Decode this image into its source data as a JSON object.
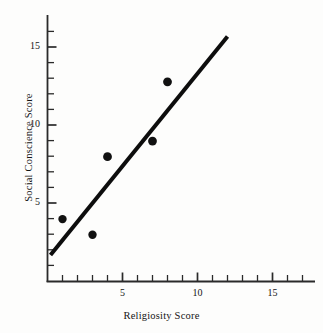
{
  "chart_data": {
    "type": "scatter",
    "title": "",
    "xlabel": "Religiosity Score",
    "ylabel": "Social Conscience Score",
    "xlim": [
      0,
      17.8
    ],
    "ylim": [
      0,
      17
    ],
    "grid": false,
    "legend": "none",
    "x": [
      1,
      3,
      4,
      7,
      8
    ],
    "y": [
      4,
      3,
      8,
      9,
      12.8
    ],
    "points": [
      {
        "x": 1,
        "y": 4
      },
      {
        "x": 3,
        "y": 3
      },
      {
        "x": 4,
        "y": 8
      },
      {
        "x": 7,
        "y": 9
      },
      {
        "x": 8,
        "y": 12.8
      }
    ],
    "xticks_major": [
      5,
      10,
      15
    ],
    "yticks_major": [
      5,
      10,
      15
    ],
    "xtick_labels": [
      "5",
      "10",
      "15"
    ],
    "ytick_labels": [
      "5",
      "10",
      "15"
    ],
    "xticks_minor_step": 1,
    "yticks_minor_step": 1,
    "marker": "filled-circle",
    "marker_color": "#111111",
    "series": [
      {
        "name": "observations",
        "values": [
          {
            "x": 1,
            "y": 4
          },
          {
            "x": 3,
            "y": 3
          },
          {
            "x": 4,
            "y": 8
          },
          {
            "x": 7,
            "y": 9
          },
          {
            "x": 8,
            "y": 12.8
          }
        ]
      }
    ],
    "trendline": {
      "type": "linear-fit",
      "x_start": 0.2,
      "y_start": 1.7,
      "x_end": 12.0,
      "y_end": 15.7,
      "color": "#0d0d0d",
      "width_px": 4
    },
    "axes": {
      "x_axis_color": "#2a2a2a",
      "y_axis_color": "#2a2a2a",
      "tick_direction": "in"
    }
  },
  "figure": {
    "background": "#fdfdfc"
  }
}
